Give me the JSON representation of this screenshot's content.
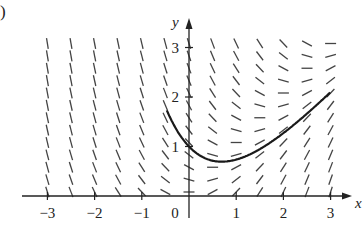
{
  "figure": {
    "part_label": ")"
  },
  "chart_data": {
    "type": "slope_field",
    "differential_equation": "dy/dx = x - y",
    "title": "",
    "xlabel": "x",
    "ylabel": "y",
    "xlim": [
      -3,
      3
    ],
    "ylim": [
      0,
      3
    ],
    "x_ticks": [
      -3,
      -2,
      -1,
      0,
      1,
      2,
      3
    ],
    "x_tick_labels": [
      "-3",
      "-2",
      "-1",
      "0",
      "1",
      "2",
      "3"
    ],
    "y_ticks": [
      1,
      2,
      3
    ],
    "y_tick_labels": [
      "1",
      "2",
      "3"
    ],
    "grid": false,
    "field_grid": {
      "x_values": [
        -3,
        -2.5,
        -2,
        -1.5,
        -1,
        -0.5,
        0,
        0.5,
        1,
        1.5,
        2,
        2.5,
        3
      ],
      "y_values": [
        0,
        0.25,
        0.5,
        0.75,
        1,
        1.25,
        1.5,
        1.75,
        2,
        2.25,
        2.5,
        2.75,
        3
      ]
    },
    "series": [
      {
        "name": "solution curve through (0,1)",
        "equation": "y = x - 1 + 2e^(-x)",
        "x": [
          -0.45,
          -0.25,
          0,
          0.25,
          0.5,
          0.7,
          1,
          1.5,
          2,
          2.5,
          3
        ],
        "y": [
          3.2,
          1.82,
          1.0,
          0.81,
          0.71,
          0.69,
          0.74,
          0.95,
          1.27,
          1.66,
          2.1
        ]
      }
    ]
  },
  "colors": {
    "ink": "#222222",
    "segment": "#444444",
    "background": "#ffffff"
  }
}
